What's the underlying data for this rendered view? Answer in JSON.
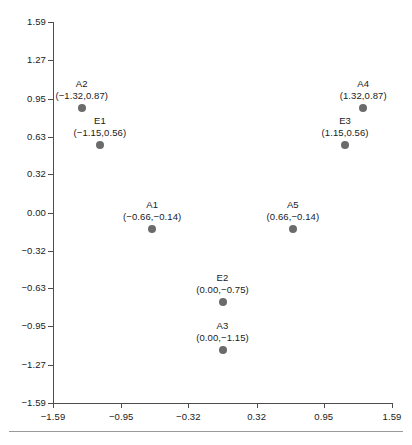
{
  "chart_data": {
    "type": "scatter",
    "title": "",
    "xlabel": "",
    "ylabel": "",
    "xlim": [
      -1.59,
      1.59
    ],
    "ylim": [
      -1.59,
      1.59
    ],
    "grid": false,
    "legend": "none",
    "xticks": [
      "-1.59",
      "-0.95",
      "-0.32",
      "0.32",
      "0.95",
      "1.59"
    ],
    "xtick_values": [
      -1.59,
      -0.95,
      -0.32,
      0.32,
      0.95,
      1.59
    ],
    "yticks": [
      "1.59",
      "1.27",
      "0.95",
      "0.63",
      "0.32",
      "0.00",
      "-0.32",
      "-0.63",
      "-0.95",
      "-1.27",
      "-1.59"
    ],
    "ytick_values": [
      1.59,
      1.27,
      0.95,
      0.63,
      0.32,
      0.0,
      -0.32,
      -0.63,
      -0.95,
      -1.27,
      -1.59
    ],
    "marker_color": "#6b6b6b",
    "axis_color": "#4d4d4d",
    "points": [
      {
        "name": "A2",
        "x": -1.32,
        "y": 0.87,
        "coords": "(−1.32,0.87)"
      },
      {
        "name": "E1",
        "x": -1.15,
        "y": 0.56,
        "coords": "(−1.15,0.56)"
      },
      {
        "name": "A1",
        "x": -0.66,
        "y": -0.14,
        "coords": "(−0.66,−0.14)"
      },
      {
        "name": "A5",
        "x": 0.66,
        "y": -0.14,
        "coords": "(0.66,−0.14)"
      },
      {
        "name": "E3",
        "x": 1.15,
        "y": 0.56,
        "coords": "(1.15,0.56)"
      },
      {
        "name": "A4",
        "x": 1.32,
        "y": 0.87,
        "coords": "(1.32,0.87)"
      },
      {
        "name": "E2",
        "x": 0.0,
        "y": -0.75,
        "coords": "(0.00,−0.75)"
      },
      {
        "name": "A3",
        "x": 0.0,
        "y": -1.15,
        "coords": "(0.00,−1.15)"
      }
    ]
  }
}
